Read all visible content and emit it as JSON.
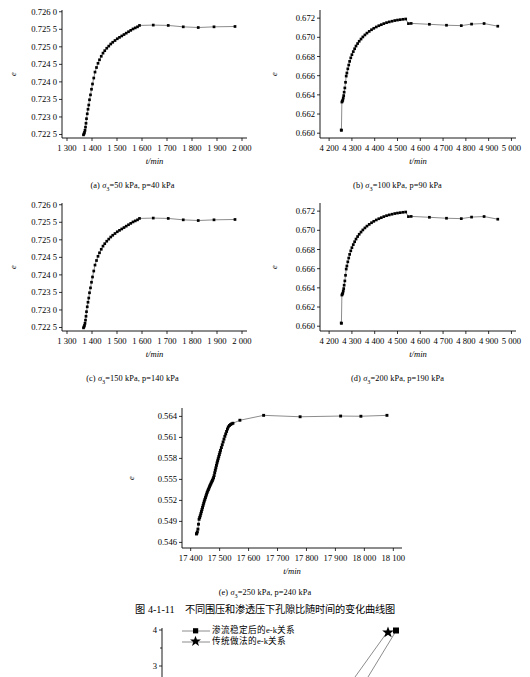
{
  "figure": {
    "title": "图 4-1-11　不同围压和渗透压下孔隙比随时间的变化曲线图",
    "axis_y_label": "e",
    "axis_x_label": "t/min"
  },
  "bottom_legend": {
    "item1": "渗流稳定后的e-k关系",
    "item2": "传统做法的e-k关系",
    "y_ticks": [
      "4",
      "3"
    ]
  },
  "chart_data": [
    {
      "id": "a",
      "type": "line",
      "caption_prefix": "(a)",
      "caption_sigma": "σ",
      "caption_sub": "3",
      "caption_rest": "=50 kPa, p=40 kPa",
      "title": "",
      "xlabel": "t/min",
      "ylabel": "e",
      "xlim": [
        1280,
        2020
      ],
      "ylim": [
        0.7224,
        0.72605
      ],
      "xticks": [
        1300,
        1400,
        1500,
        1600,
        1700,
        1800,
        1900,
        2000
      ],
      "xticklabels": [
        "1 300",
        "1 400",
        "1 500",
        "1 600",
        "1 700",
        "1 800",
        "1 900",
        "2 000"
      ],
      "yticks": [
        0.7225,
        0.723,
        0.7235,
        0.724,
        0.7245,
        0.725,
        0.7255,
        0.726
      ],
      "yticklabels": [
        "0.722 5",
        "0.723 0",
        "0.723 5",
        "0.724 0",
        "0.724 5",
        "0.725 0",
        "0.725 5",
        "0.726 0"
      ],
      "grid": false,
      "legend": "none",
      "x": [
        1366,
        1368,
        1370,
        1372,
        1374,
        1376,
        1378,
        1381,
        1384,
        1387,
        1390,
        1394,
        1398,
        1402,
        1407,
        1412,
        1418,
        1424,
        1430,
        1437,
        1444,
        1451,
        1459,
        1467,
        1475,
        1483,
        1492,
        1501,
        1510,
        1519,
        1528,
        1537,
        1546,
        1555,
        1564,
        1573,
        1582,
        1590,
        1645,
        1705,
        1765,
        1825,
        1888,
        1972
      ],
      "y": [
        0.72249,
        0.72252,
        0.72256,
        0.72262,
        0.72271,
        0.72282,
        0.72295,
        0.72309,
        0.72322,
        0.72334,
        0.72349,
        0.72363,
        0.72379,
        0.72394,
        0.72411,
        0.72428,
        0.72441,
        0.72453,
        0.72463,
        0.72473,
        0.72482,
        0.72489,
        0.72496,
        0.72502,
        0.72508,
        0.72513,
        0.72518,
        0.72523,
        0.72527,
        0.72531,
        0.72535,
        0.72539,
        0.72543,
        0.72547,
        0.72551,
        0.72554,
        0.72557,
        0.72561,
        0.72562,
        0.72561,
        0.72557,
        0.72555,
        0.72557,
        0.72558
      ]
    },
    {
      "id": "b",
      "type": "line",
      "caption_prefix": "(b)",
      "caption_sigma": "σ",
      "caption_sub": "3",
      "caption_rest": "=100 kPa, p=90 kPa",
      "title": "",
      "xlabel": "t/min",
      "ylabel": "e",
      "xlim": [
        4160,
        5020
      ],
      "ylim": [
        0.6595,
        0.67285
      ],
      "xticks": [
        4200,
        4300,
        4400,
        4500,
        4600,
        4700,
        4800,
        4900,
        5000
      ],
      "xticklabels": [
        "4 200",
        "4 300",
        "4 400",
        "4 500",
        "4 600",
        "4 700",
        "4 800",
        "4 900",
        "5 000"
      ],
      "yticks": [
        0.66,
        0.662,
        0.664,
        0.666,
        0.668,
        0.67,
        0.672
      ],
      "yticklabels": [
        "0.660",
        "0.662",
        "0.664",
        "0.666",
        "0.668",
        "0.670",
        "0.672"
      ],
      "grid": false,
      "legend": "none",
      "x": [
        4253,
        4254,
        4256,
        4258,
        4260,
        4262,
        4264,
        4266,
        4269,
        4272,
        4275,
        4278,
        4282,
        4286,
        4290,
        4295,
        4300,
        4306,
        4312,
        4318,
        4325,
        4332,
        4340,
        4348,
        4357,
        4366,
        4376,
        4386,
        4396,
        4407,
        4418,
        4429,
        4440,
        4452,
        4464,
        4476,
        4488,
        4500,
        4512,
        4524,
        4536,
        4548,
        4560,
        4640,
        4715,
        4780,
        4825,
        4880,
        4940
      ],
      "y": [
        0.66034,
        0.6603,
        0.66325,
        0.66335,
        0.66345,
        0.66367,
        0.66392,
        0.66428,
        0.66472,
        0.66531,
        0.66596,
        0.66628,
        0.66671,
        0.66711,
        0.66749,
        0.66786,
        0.66819,
        0.66851,
        0.66881,
        0.66909,
        0.66935,
        0.66959,
        0.66982,
        0.67004,
        0.67025,
        0.67044,
        0.67062,
        0.67079,
        0.67094,
        0.67108,
        0.67121,
        0.67132,
        0.67143,
        0.67153,
        0.67161,
        0.67168,
        0.67175,
        0.6718,
        0.67184,
        0.67188,
        0.67191,
        0.67143,
        0.67145,
        0.67136,
        0.67126,
        0.67122,
        0.67138,
        0.67144,
        0.67116
      ]
    },
    {
      "id": "c",
      "type": "line",
      "caption_prefix": "(c)",
      "caption_sigma": "σ",
      "caption_sub": "3",
      "caption_rest": "=150 kPa, p=140 kPa",
      "title": "",
      "xlabel": "t/min",
      "ylabel": "e",
      "xlim": [
        1280,
        2020
      ],
      "ylim": [
        0.7224,
        0.72605
      ],
      "xticks": [
        1300,
        1400,
        1500,
        1600,
        1700,
        1800,
        1900,
        2000
      ],
      "xticklabels": [
        "1 300",
        "1 400",
        "1 500",
        "1 600",
        "1 700",
        "1 800",
        "1 900",
        "2 000"
      ],
      "yticks": [
        0.7225,
        0.723,
        0.7235,
        0.724,
        0.7245,
        0.725,
        0.7255,
        0.726
      ],
      "yticklabels": [
        "0.722 5",
        "0.723 0",
        "0.723 5",
        "0.724 0",
        "0.724 5",
        "0.725 0",
        "0.725 5",
        "0.726 0"
      ],
      "grid": false,
      "legend": "none",
      "x": [
        1366,
        1368,
        1370,
        1372,
        1374,
        1376,
        1378,
        1381,
        1384,
        1387,
        1390,
        1394,
        1398,
        1402,
        1407,
        1412,
        1418,
        1424,
        1430,
        1437,
        1444,
        1451,
        1459,
        1467,
        1475,
        1483,
        1492,
        1501,
        1510,
        1519,
        1528,
        1537,
        1546,
        1555,
        1564,
        1573,
        1582,
        1590,
        1645,
        1705,
        1765,
        1825,
        1888,
        1972
      ],
      "y": [
        0.72249,
        0.72252,
        0.72256,
        0.72262,
        0.72271,
        0.72282,
        0.72295,
        0.72309,
        0.72322,
        0.72334,
        0.72349,
        0.72363,
        0.72379,
        0.72394,
        0.72411,
        0.72428,
        0.72441,
        0.72453,
        0.72463,
        0.72473,
        0.72482,
        0.72489,
        0.72496,
        0.72502,
        0.72508,
        0.72513,
        0.72518,
        0.72523,
        0.72527,
        0.72531,
        0.72535,
        0.72539,
        0.72543,
        0.72547,
        0.72551,
        0.72554,
        0.72557,
        0.72561,
        0.72562,
        0.72561,
        0.72557,
        0.72555,
        0.72557,
        0.72558
      ]
    },
    {
      "id": "d",
      "type": "line",
      "caption_prefix": "(d)",
      "caption_sigma": "σ",
      "caption_sub": "3",
      "caption_rest": "=200 kPa, p=190 kPa",
      "title": "",
      "xlabel": "t/min",
      "ylabel": "e",
      "xlim": [
        4160,
        5020
      ],
      "ylim": [
        0.6595,
        0.67285
      ],
      "xticks": [
        4200,
        4300,
        4400,
        4500,
        4600,
        4700,
        4800,
        4900,
        5000
      ],
      "xticklabels": [
        "4 200",
        "4 300",
        "4 400",
        "4 500",
        "4 600",
        "4 700",
        "4 800",
        "4 900",
        "5 000"
      ],
      "yticks": [
        0.66,
        0.662,
        0.664,
        0.666,
        0.668,
        0.67,
        0.672
      ],
      "yticklabels": [
        "0.660",
        "0.662",
        "0.664",
        "0.666",
        "0.668",
        "0.670",
        "0.672"
      ],
      "grid": false,
      "legend": "none",
      "x": [
        4253,
        4254,
        4256,
        4258,
        4260,
        4262,
        4264,
        4266,
        4269,
        4272,
        4275,
        4278,
        4282,
        4286,
        4290,
        4295,
        4300,
        4306,
        4312,
        4318,
        4325,
        4332,
        4340,
        4348,
        4357,
        4366,
        4376,
        4386,
        4396,
        4407,
        4418,
        4429,
        4440,
        4452,
        4464,
        4476,
        4488,
        4500,
        4512,
        4524,
        4536,
        4548,
        4560,
        4640,
        4715,
        4780,
        4825,
        4880,
        4940
      ],
      "y": [
        0.66034,
        0.6603,
        0.66325,
        0.66335,
        0.66345,
        0.66367,
        0.66392,
        0.66428,
        0.66472,
        0.66531,
        0.66596,
        0.66628,
        0.66671,
        0.66711,
        0.66749,
        0.66786,
        0.66819,
        0.66851,
        0.66881,
        0.66909,
        0.66935,
        0.66959,
        0.66982,
        0.67004,
        0.67025,
        0.67044,
        0.67062,
        0.67079,
        0.67094,
        0.67108,
        0.67121,
        0.67132,
        0.67143,
        0.67153,
        0.67161,
        0.67168,
        0.67175,
        0.6718,
        0.67184,
        0.67188,
        0.67191,
        0.67143,
        0.67145,
        0.67136,
        0.67126,
        0.67122,
        0.67138,
        0.67144,
        0.67116
      ]
    },
    {
      "id": "e",
      "type": "line",
      "caption_prefix": "(e)",
      "caption_sigma": "σ",
      "caption_sub": "3",
      "caption_rest": "=250 kPa, p=240 kPa",
      "title": "",
      "xlabel": "t/min",
      "ylabel": "e",
      "xlim": [
        17370,
        18130
      ],
      "ylim": [
        0.5452,
        0.5652
      ],
      "xticks": [
        17400,
        17500,
        17600,
        17700,
        17800,
        17900,
        18000,
        18100
      ],
      "xticklabels": [
        "17 400",
        "17 500",
        "17 600",
        "17 700",
        "17 800",
        "17 900",
        "18 000",
        "18 100"
      ],
      "yticks": [
        0.546,
        0.549,
        0.552,
        0.555,
        0.558,
        0.561,
        0.564
      ],
      "yticklabels": [
        "0.546",
        "0.549",
        "0.552",
        "0.555",
        "0.558",
        "0.561",
        "0.564"
      ],
      "grid": false,
      "legend": "none",
      "x": [
        17420,
        17421,
        17423,
        17425,
        17427,
        17429,
        17431,
        17433,
        17435,
        17437,
        17439,
        17441,
        17443,
        17445,
        17447,
        17449,
        17451,
        17453,
        17455,
        17457,
        17459,
        17461,
        17463,
        17465,
        17467,
        17469,
        17471,
        17473,
        17475,
        17477,
        17479,
        17481,
        17483,
        17485,
        17487,
        17489,
        17491,
        17493,
        17495,
        17497,
        17499,
        17501,
        17503,
        17506,
        17509,
        17512,
        17515,
        17518,
        17521,
        17524,
        17527,
        17530,
        17534,
        17538,
        17542,
        17546,
        17570,
        17652,
        17778,
        17918,
        17988,
        18078
      ],
      "y": [
        0.5472,
        0.5473,
        0.5475,
        0.5479,
        0.5486,
        0.5493,
        0.54955,
        0.5498,
        0.5501,
        0.5504,
        0.5507,
        0.551,
        0.5513,
        0.5516,
        0.5519,
        0.55215,
        0.5524,
        0.55265,
        0.5529,
        0.55315,
        0.55335,
        0.55355,
        0.55375,
        0.55395,
        0.55415,
        0.55432,
        0.5545,
        0.55468,
        0.55485,
        0.55505,
        0.55525,
        0.55555,
        0.55595,
        0.5563,
        0.55665,
        0.557,
        0.55735,
        0.55765,
        0.55795,
        0.55825,
        0.55855,
        0.55885,
        0.55915,
        0.55955,
        0.55995,
        0.56035,
        0.56075,
        0.56115,
        0.5615,
        0.56185,
        0.5622,
        0.5625,
        0.5627,
        0.56285,
        0.56295,
        0.56302,
        0.56345,
        0.56415,
        0.56395,
        0.56405,
        0.56402,
        0.56415
      ]
    }
  ]
}
